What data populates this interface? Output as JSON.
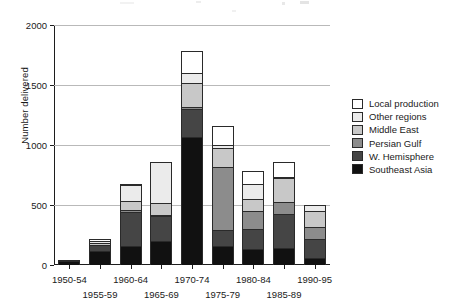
{
  "chart_data": {
    "type": "bar",
    "stacked": true,
    "title": "",
    "subtitle": "",
    "xlabel": "",
    "ylabel": "Number delivered",
    "ylim": [
      0,
      2000
    ],
    "yticks": [
      0,
      500,
      1000,
      1500,
      2000
    ],
    "ytick_labels": [
      "0",
      "500",
      "1000",
      "1500",
      "2000"
    ],
    "grid": "horizontal",
    "legend_position": "right",
    "categories": [
      "1950-54",
      "1955-59",
      "1960-64",
      "1965-69",
      "1970-74",
      "1975-79",
      "1980-84",
      "1985-89",
      "1990-95"
    ],
    "series": [
      {
        "name": "Southeast Asia",
        "color": "#111111",
        "values": [
          35,
          120,
          160,
          200,
          1070,
          160,
          135,
          145,
          60
        ]
      },
      {
        "name": "W. Hemisphere",
        "color": "#454545",
        "values": [
          3,
          50,
          290,
          215,
          240,
          135,
          175,
          285,
          160
        ]
      },
      {
        "name": "Persian Gulf",
        "color": "#8c8c8c",
        "values": [
          0,
          10,
          20,
          15,
          20,
          530,
          150,
          105,
          105
        ]
      },
      {
        "name": "Middle East",
        "color": "#c8c8c8",
        "values": [
          0,
          20,
          80,
          100,
          200,
          170,
          110,
          205,
          140
        ]
      },
      {
        "name": "Other regions",
        "color": "#ebebeb",
        "values": [
          2,
          20,
          140,
          350,
          90,
          30,
          130,
          15,
          55
        ]
      },
      {
        "name": "Local production",
        "color": "#ffffff",
        "values": [
          0,
          25,
          10,
          10,
          190,
          165,
          110,
          130,
          0
        ]
      }
    ],
    "totals": [
      40,
      245,
      700,
      890,
      1810,
      1190,
      810,
      885,
      520
    ]
  },
  "legend": {
    "items": [
      {
        "label": "Local production",
        "color": "#ffffff"
      },
      {
        "label": "Other regions",
        "color": "#ebebeb"
      },
      {
        "label": "Middle East",
        "color": "#c8c8c8"
      },
      {
        "label": "Persian Gulf",
        "color": "#8c8c8c"
      },
      {
        "label": "W. Hemisphere",
        "color": "#454545"
      },
      {
        "label": "Southeast Asia",
        "color": "#111111"
      }
    ]
  },
  "axes": {
    "y_title": "Number delivered",
    "axis_color": "#1d1d1d",
    "grid_color": "#b9b9b9"
  }
}
